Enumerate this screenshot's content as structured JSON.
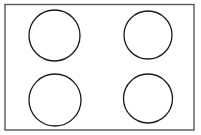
{
  "diagram": {
    "type": "line-drawing",
    "canvas": {
      "width": 201,
      "height": 135,
      "background": "#ffffff"
    },
    "surface": {
      "name": "cooktop-surface",
      "shape": "rectangle",
      "x": 5,
      "y": 4.5,
      "width": 189,
      "height": 125.5,
      "fill": "#ffffff",
      "stroke": "#555555",
      "stroke_width": 1.4
    },
    "burners": [
      {
        "name": "burner-top-left",
        "position": "top-left",
        "cx": 54.5,
        "cy": 35.5,
        "r": 25.5,
        "fill": "#ffffff",
        "stroke": "#1a1a1a",
        "stroke_width": 1.3
      },
      {
        "name": "burner-top-right",
        "position": "top-right",
        "cx": 148,
        "cy": 35,
        "r": 24,
        "fill": "#ffffff",
        "stroke": "#1a1a1a",
        "stroke_width": 1.3
      },
      {
        "name": "burner-bottom-left",
        "position": "bottom-left",
        "cx": 55,
        "cy": 100,
        "r": 26,
        "fill": "#ffffff",
        "stroke": "#1a1a1a",
        "stroke_width": 1.3
      },
      {
        "name": "burner-bottom-right",
        "position": "bottom-right",
        "cx": 148,
        "cy": 98.5,
        "r": 24.5,
        "fill": "#ffffff",
        "stroke": "#1a1a1a",
        "stroke_width": 1.3
      }
    ]
  }
}
